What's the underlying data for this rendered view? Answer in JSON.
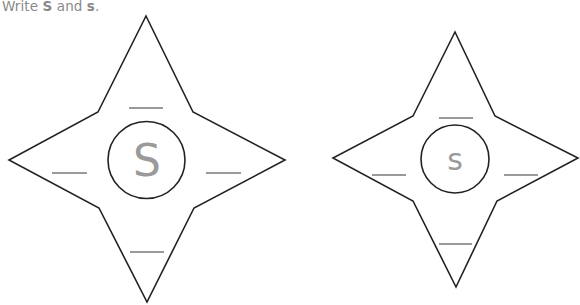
{
  "instruction": {
    "prefix": "Write ",
    "upper": "S",
    "middle": " and ",
    "lower": "s",
    "suffix": "."
  },
  "stars": [
    {
      "name": "uppercase-star",
      "letter": "S",
      "blanks": 4
    },
    {
      "name": "lowercase-star",
      "letter": "s",
      "blanks": 4
    }
  ],
  "colors": {
    "outline": "#222222",
    "guide_letter": "#9a9a9a",
    "blank_line": "#9a9a9a"
  }
}
